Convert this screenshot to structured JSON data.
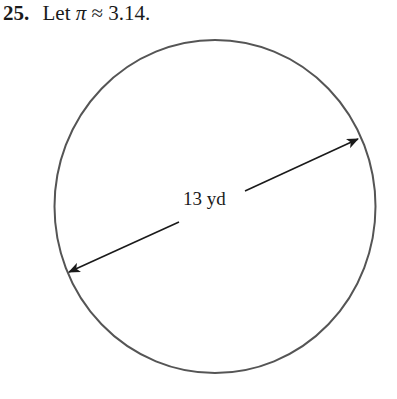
{
  "problem": {
    "number": "25.",
    "text_prefix": "Let",
    "pi_symbol": "π",
    "approx_symbol": "≈",
    "pi_value": "3.14."
  },
  "figure": {
    "shape": "circle",
    "dimension": "diameter",
    "label": "13 yd",
    "stroke_color": "#555555",
    "arrow_color": "#1a1a1a"
  }
}
